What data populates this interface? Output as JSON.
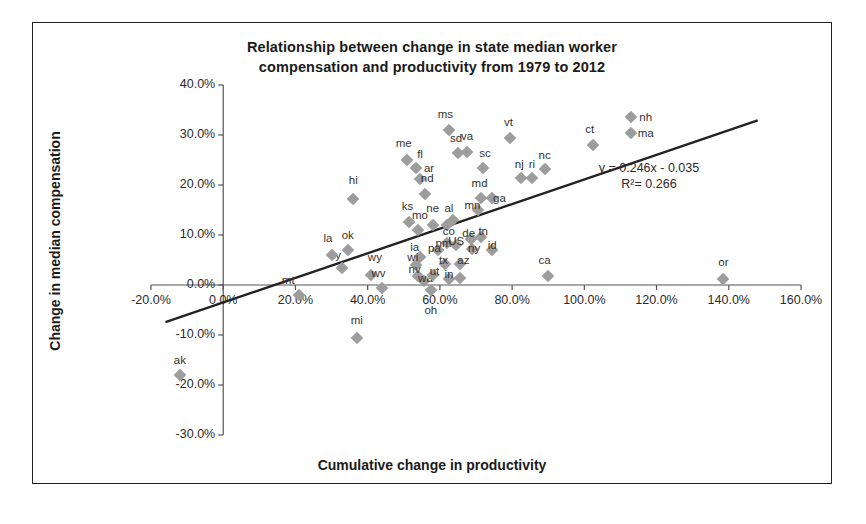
{
  "chart_data": {
    "type": "scatter",
    "title": "Relationship between change in state median worker compensation and productivity from 1979 to 2012",
    "title_line1": "Relationship between change in state median worker",
    "title_line2": "compensation and productivity from 1979 to 2012",
    "xlabel": "Cumulative change in productivity",
    "ylabel": "Change in median compensation",
    "xlim": [
      -20,
      160
    ],
    "ylim": [
      -30,
      40
    ],
    "xticks": [
      "-20.0%",
      "0.0%",
      "20.0%",
      "40.0%",
      "60.0%",
      "80.0%",
      "100.0%",
      "120.0%",
      "140.0%",
      "160.0%"
    ],
    "xtick_values": [
      -20,
      0,
      20,
      40,
      60,
      80,
      100,
      120,
      140,
      160
    ],
    "yticks": [
      "40.0%",
      "30.0%",
      "20.0%",
      "10.0%",
      "0.0%",
      "-10.0%",
      "-20.0%",
      "-30.0%"
    ],
    "ytick_values": [
      40,
      30,
      20,
      10,
      0,
      -10,
      -20,
      -30
    ],
    "grid": false,
    "legend": "none",
    "marker_color": "#9d9d9d",
    "trendline_color": "#222222",
    "trendline": {
      "equation": "y = 0.246x - 0.035",
      "r2": "R²= 0.266",
      "slope": 0.246,
      "intercept": -3.5,
      "x_start": -16,
      "x_end": 148
    },
    "points": [
      {
        "label": "ak",
        "x": -12.0,
        "y": -18.0,
        "lx": -12.0,
        "ly": -15.0
      },
      {
        "label": "mt",
        "x": 21.0,
        "y": -2.0,
        "lx": 18.0,
        "ly": 1.0
      },
      {
        "label": "hi",
        "x": 36.0,
        "y": 17.3,
        "lx": 36.0,
        "ly": 21.0
      },
      {
        "label": "ky",
        "x": 33.0,
        "y": 3.5,
        "lx": 31.0,
        "ly": 6.0
      },
      {
        "label": "la",
        "x": 30.0,
        "y": 6.0,
        "lx": 29.0,
        "ly": 9.4
      },
      {
        "label": "ok",
        "x": 34.5,
        "y": 7.0,
        "lx": 34.5,
        "ly": 10.0
      },
      {
        "label": "wy",
        "x": 41.0,
        "y": 2.0,
        "lx": 42.0,
        "ly": 5.6
      },
      {
        "label": "wv",
        "x": 44.0,
        "y": -0.5,
        "lx": 43.0,
        "ly": 2.5
      },
      {
        "label": "mi",
        "x": 37.0,
        "y": -10.5,
        "lx": 37.0,
        "ly": -7.0
      },
      {
        "label": "me",
        "x": 51.0,
        "y": 25.0,
        "lx": 50.0,
        "ly": 28.5
      },
      {
        "label": "fl",
        "x": 53.5,
        "y": 23.5,
        "lx": 54.5,
        "ly": 26.3
      },
      {
        "label": "ar",
        "x": 54.5,
        "y": 21.3,
        "lx": 57.0,
        "ly": 23.5
      },
      {
        "label": "nd",
        "x": 56.0,
        "y": 18.2,
        "lx": 56.5,
        "ly": 21.4
      },
      {
        "label": "ks",
        "x": 51.5,
        "y": 12.7,
        "lx": 51.0,
        "ly": 15.8
      },
      {
        "label": "mo",
        "x": 54.0,
        "y": 11.0,
        "lx": 54.5,
        "ly": 14.0
      },
      {
        "label": "ne",
        "x": 58.0,
        "y": 12.0,
        "lx": 58.0,
        "ly": 15.5
      },
      {
        "label": "al",
        "x": 62.0,
        "y": 12.0,
        "lx": 62.5,
        "ly": 15.5
      },
      {
        "label": "ia",
        "x": 54.5,
        "y": 5.7,
        "lx": 53.0,
        "ly": 7.6
      },
      {
        "label": "wi",
        "x": 53.5,
        "y": 4.0,
        "lx": 52.5,
        "ly": 5.6
      },
      {
        "label": "nv",
        "x": 54.0,
        "y": 1.8,
        "lx": 53.0,
        "ly": 3.3
      },
      {
        "label": "wa",
        "x": 55.5,
        "y": 0.8,
        "lx": 56.0,
        "ly": 1.5
      },
      {
        "label": "ut",
        "x": 58.0,
        "y": 2.0,
        "lx": 58.5,
        "ly": 2.8
      },
      {
        "label": "pa",
        "x": 59.5,
        "y": 7.0,
        "lx": 58.5,
        "ly": 7.4
      },
      {
        "label": "tx",
        "x": 61.5,
        "y": 4.3,
        "lx": 61.0,
        "ly": 5.0
      },
      {
        "label": "in",
        "x": 62.5,
        "y": 1.3,
        "lx": 62.5,
        "ly": 2.2
      },
      {
        "label": "ms",
        "x": 62.5,
        "y": 31.0,
        "lx": 61.5,
        "ly": 34.3
      },
      {
        "label": "sd",
        "x": 65.0,
        "y": 26.5,
        "lx": 64.5,
        "ly": 29.5
      },
      {
        "label": "va",
        "x": 67.5,
        "y": 26.7,
        "lx": 67.5,
        "ly": 29.8
      },
      {
        "label": "oh",
        "x": 57.5,
        "y": -1.0,
        "lx": 57.5,
        "ly": -5.0
      },
      {
        "label": "il",
        "x": 65.5,
        "y": 1.5,
        "lx": 65.5,
        "ly": 4.5
      },
      {
        "label": "az",
        "x": 65.5,
        "y": 4.3,
        "lx": 66.5,
        "ly": 5.1
      },
      {
        "label": "co",
        "x": 63.5,
        "y": 13.0,
        "lx": 62.5,
        "ly": 10.9
      },
      {
        "label": "nm",
        "x": 62.0,
        "y": 8.5,
        "lx": 61.0,
        "ly": 8.5
      },
      {
        "label": "US",
        "x": 64.5,
        "y": 8.0,
        "lx": 64.5,
        "ly": 8.8
      },
      {
        "label": "de",
        "x": 68.5,
        "y": 9.3,
        "lx": 68.0,
        "ly": 10.5
      },
      {
        "label": "tn",
        "x": 71.5,
        "y": 9.7,
        "lx": 72.0,
        "ly": 10.8
      },
      {
        "label": "ny",
        "x": 69.0,
        "y": 7.2,
        "lx": 69.5,
        "ly": 7.4
      },
      {
        "label": "id",
        "x": 74.5,
        "y": 7.0,
        "lx": 74.5,
        "ly": 8.0
      },
      {
        "label": "mn",
        "x": 70.5,
        "y": 15.0,
        "lx": 69.0,
        "ly": 16.1
      },
      {
        "label": "md",
        "x": 71.5,
        "y": 17.5,
        "lx": 71.0,
        "ly": 20.5
      },
      {
        "label": "ga",
        "x": 74.5,
        "y": 17.5,
        "lx": 76.5,
        "ly": 17.5
      },
      {
        "label": "sc",
        "x": 72.0,
        "y": 23.5,
        "lx": 72.5,
        "ly": 26.5
      },
      {
        "label": "vt",
        "x": 79.5,
        "y": 29.5,
        "lx": 79.0,
        "ly": 32.6
      },
      {
        "label": "nj",
        "x": 82.5,
        "y": 21.5,
        "lx": 82.0,
        "ly": 24.2
      },
      {
        "label": "ri",
        "x": 85.5,
        "y": 21.5,
        "lx": 85.5,
        "ly": 24.2
      },
      {
        "label": "nc",
        "x": 89.0,
        "y": 23.3,
        "lx": 89.0,
        "ly": 26.0
      },
      {
        "label": "ca",
        "x": 90.0,
        "y": 1.8,
        "lx": 89.0,
        "ly": 5.0
      },
      {
        "label": "ct",
        "x": 102.5,
        "y": 28.0,
        "lx": 101.5,
        "ly": 31.2
      },
      {
        "label": "nh",
        "x": 113.0,
        "y": 33.7,
        "lx": 117.0,
        "ly": 33.7
      },
      {
        "label": "ma",
        "x": 113.0,
        "y": 30.4,
        "lx": 117.0,
        "ly": 30.4
      },
      {
        "label": "or",
        "x": 138.5,
        "y": 1.3,
        "lx": 138.5,
        "ly": 4.7
      }
    ]
  }
}
